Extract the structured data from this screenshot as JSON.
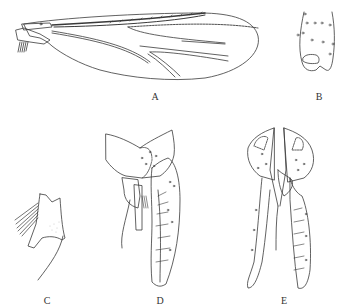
{
  "figure": {
    "panels": [
      {
        "id": "A",
        "label": "A",
        "subject": "wing"
      },
      {
        "id": "B",
        "label": "B",
        "subject": "gonostylus tip / segment"
      },
      {
        "id": "C",
        "label": "C",
        "subject": "lateral appendage with setae"
      },
      {
        "id": "D",
        "label": "D",
        "subject": "hypopygium dorsal view"
      },
      {
        "id": "E",
        "label": "E",
        "subject": "hypopygium ventral view"
      }
    ]
  },
  "colors": {
    "line": "#3a3a3a",
    "background": "#ffffff"
  }
}
